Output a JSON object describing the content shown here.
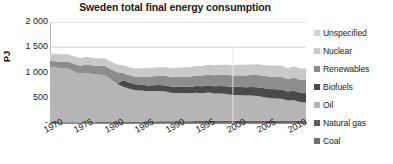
{
  "chart": {
    "title": "Sweden total final energy consumption",
    "ylabel": "PJ"
  },
  "legend": {
    "items": [
      {
        "label": "Unspecified",
        "color": "#d4d4d4"
      },
      {
        "label": "Nuclear",
        "color": "#c9c9c9"
      },
      {
        "label": "Renewables",
        "color": "#8d8d8d"
      },
      {
        "label": "Biofuels",
        "color": "#4a4a4a"
      },
      {
        "label": "Oil",
        "color": "#b5b5b5"
      },
      {
        "label": "Natural gas",
        "color": "#5e5e5e"
      },
      {
        "label": "Coal",
        "color": "#6e6e6e"
      }
    ]
  },
  "chart_data": {
    "type": "area",
    "stacked": true,
    "title": "Sweden total final energy consumption",
    "xlabel": "",
    "ylabel": "PJ",
    "ylim": [
      0,
      2000
    ],
    "ytick_labels": [
      "2 000",
      "1 500",
      "1 000",
      "500",
      "-"
    ],
    "ytick_values": [
      2000,
      1500,
      1000,
      500,
      0
    ],
    "grid": true,
    "legend_position": "right",
    "xlim": [
      1970,
      2012
    ],
    "xtick_labels": [
      "1970",
      "1975",
      "1980",
      "1985",
      "1990",
      "1995",
      "2000",
      "2005",
      "2010"
    ],
    "xtick_values": [
      1970,
      1975,
      1980,
      1985,
      1990,
      1995,
      2000,
      2005,
      2010
    ],
    "x": [
      1970,
      1971,
      1972,
      1973,
      1974,
      1975,
      1976,
      1977,
      1978,
      1979,
      1980,
      1981,
      1982,
      1983,
      1984,
      1985,
      1986,
      1987,
      1988,
      1989,
      1990,
      1991,
      1992,
      1993,
      1994,
      1995,
      1996,
      1997,
      1998,
      1999,
      2000,
      2001,
      2002,
      2003,
      2004,
      2005,
      2006,
      2007,
      2008,
      2009,
      2010,
      2011,
      2012
    ],
    "series": [
      {
        "name": "Coal",
        "color": "#6e6e6e",
        "values": [
          18,
          18,
          17,
          17,
          16,
          16,
          17,
          17,
          18,
          18,
          19,
          19,
          18,
          18,
          18,
          19,
          19,
          19,
          19,
          19,
          18,
          18,
          18,
          18,
          19,
          19,
          20,
          20,
          20,
          20,
          20,
          21,
          21,
          21,
          22,
          22,
          22,
          22,
          22,
          20,
          22,
          21,
          21
        ]
      },
      {
        "name": "Natural gas",
        "color": "#5e5e5e",
        "values": [
          0,
          0,
          0,
          0,
          0,
          0,
          0,
          0,
          0,
          0,
          0,
          0,
          0,
          0,
          0,
          6,
          10,
          13,
          15,
          16,
          17,
          18,
          18,
          19,
          20,
          21,
          22,
          22,
          23,
          23,
          23,
          24,
          24,
          25,
          25,
          25,
          25,
          25,
          26,
          25,
          27,
          26,
          26
        ]
      },
      {
        "name": "Oil",
        "color": "#b5b5b5",
        "values": [
          1090,
          1080,
          1060,
          1060,
          1000,
          960,
          980,
          950,
          940,
          930,
          840,
          760,
          700,
          660,
          630,
          620,
          600,
          600,
          600,
          590,
          560,
          560,
          560,
          550,
          560,
          550,
          560,
          540,
          540,
          530,
          510,
          510,
          500,
          500,
          490,
          470,
          450,
          440,
          430,
          400,
          400,
          370,
          360
        ]
      },
      {
        "name": "Biofuels",
        "color": "#4a4a4a",
        "values": [
          0,
          0,
          0,
          0,
          0,
          0,
          0,
          0,
          0,
          0,
          0,
          0,
          130,
          125,
          120,
          115,
          115,
          118,
          120,
          120,
          122,
          125,
          128,
          130,
          135,
          140,
          145,
          148,
          150,
          155,
          158,
          162,
          165,
          168,
          172,
          175,
          178,
          182,
          185,
          180,
          190,
          188,
          190
        ]
      },
      {
        "name": "Renewables",
        "color": "#8d8d8d",
        "values": [
          120,
          125,
          130,
          135,
          150,
          160,
          165,
          170,
          175,
          180,
          205,
          225,
          140,
          145,
          150,
          160,
          170,
          175,
          180,
          185,
          190,
          195,
          198,
          200,
          205,
          210,
          215,
          218,
          220,
          225,
          228,
          230,
          233,
          235,
          240,
          243,
          245,
          248,
          250,
          245,
          255,
          250,
          255
        ]
      },
      {
        "name": "Nuclear",
        "color": "#c9c9c9",
        "values": [
          150,
          150,
          150,
          150,
          150,
          150,
          150,
          150,
          150,
          150,
          150,
          155,
          155,
          158,
          160,
          165,
          168,
          170,
          172,
          175,
          178,
          180,
          182,
          185,
          188,
          190,
          192,
          195,
          198,
          200,
          202,
          205,
          208,
          210,
          212,
          215,
          218,
          220,
          222,
          215,
          225,
          222,
          225
        ]
      },
      {
        "name": "Unspecified",
        "color": "#d4d4d4",
        "values": [
          0,
          0,
          0,
          0,
          0,
          0,
          0,
          0,
          0,
          0,
          0,
          0,
          0,
          0,
          0,
          0,
          0,
          0,
          0,
          0,
          0,
          0,
          0,
          0,
          0,
          0,
          0,
          0,
          0,
          0,
          0,
          0,
          0,
          0,
          0,
          0,
          0,
          0,
          0,
          0,
          0,
          0,
          0
        ]
      }
    ],
    "total_top": [
      1378,
      1373,
      1357,
      1362,
      1316,
      1286,
      1312,
      1287,
      1283,
      1278,
      1214,
      1159,
      1143,
      1126,
      1078,
      1085,
      1082,
      1095,
      1106,
      1105,
      1085,
      1096,
      1104,
      1102,
      1127,
      1130,
      1154,
      1143,
      1151,
      1153,
      1141,
      1152,
      1151,
      1159,
      1161,
      1150,
      1138,
      1137,
      1135,
      1085,
      1119,
      1077,
      1077
    ]
  }
}
